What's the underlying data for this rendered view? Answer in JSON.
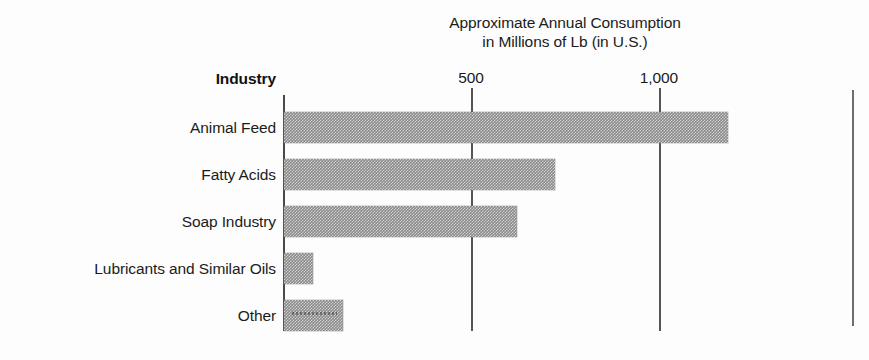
{
  "chart_data": {
    "type": "bar",
    "orientation": "horizontal",
    "title": "Approximate Annual Consumption in Millions of Lb (in U.S.)",
    "title_lines": [
      "Approximate Annual Consumption",
      "in Millions of Lb (in U.S.)"
    ],
    "category_axis_header": "Industry",
    "xlabel": "Approximate Annual Consumption in Millions of Lb (in U.S.)",
    "ylabel": "Industry",
    "categories": [
      "Animal Feed",
      "Fatty Acids",
      "Soap Industry",
      "Lubricants and Similar Oils",
      "Other"
    ],
    "values": [
      1180,
      720,
      620,
      77,
      157
    ],
    "xlim": [
      0,
      1330
    ],
    "xticks": [
      500,
      1000
    ],
    "xtick_labels": [
      "500",
      "1,000"
    ],
    "grid": "vertical-only",
    "legend": "none",
    "bar_color": "#8a8a8a",
    "axis_color": "#4a4a4a",
    "text_color": "#1b1b1b"
  },
  "figure": {
    "background": "#fdfdfd",
    "page_rule_color": "#6d6d6d"
  }
}
